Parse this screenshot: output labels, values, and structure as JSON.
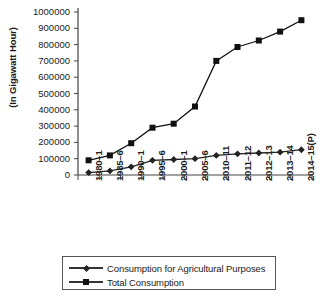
{
  "chart_data": {
    "type": "line",
    "title": "",
    "xlabel": "",
    "ylabel": "(In Gigawatt Hour)",
    "ylim": [
      0,
      1000000
    ],
    "ytick_values": [
      0,
      100000,
      200000,
      300000,
      400000,
      500000,
      600000,
      700000,
      800000,
      900000,
      1000000
    ],
    "ytick_labels": [
      "0",
      "100000",
      "200000",
      "300000",
      "400000",
      "500000",
      "600000",
      "700000",
      "800000",
      "900000",
      "1000000"
    ],
    "categories": [
      "1980–1",
      "1985–6",
      "1990–1",
      "1995–6",
      "2000–1",
      "2005–6",
      "2010–11",
      "2011–12",
      "2012–13",
      "2013–14",
      "2014–15(P)"
    ],
    "grid": false,
    "legend_position": "bottom",
    "series": [
      {
        "name": "Consumption for Agricultural Purposes",
        "marker": "diamond",
        "color": "#222222",
        "values": [
          15000,
          25000,
          50000,
          90000,
          95000,
          100000,
          120000,
          130000,
          135000,
          140000,
          155000
        ]
      },
      {
        "name": "Total Consumption",
        "marker": "square",
        "color": "#111111",
        "values": [
          90000,
          120000,
          195000,
          290000,
          315000,
          420000,
          700000,
          785000,
          825000,
          880000,
          950000
        ]
      }
    ]
  },
  "legend": {
    "items": [
      {
        "label": "Consumption for Agricultural Purposes",
        "marker": "diamond"
      },
      {
        "label": "Total Consumption",
        "marker": "square"
      }
    ]
  }
}
